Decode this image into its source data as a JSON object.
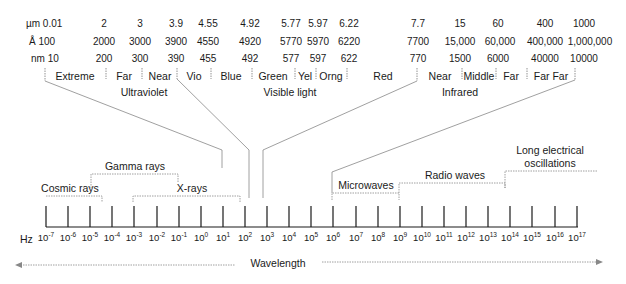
{
  "units": {
    "um": {
      "label": "µm 0.01",
      "values": [
        "2",
        "3",
        "3.9",
        "4.55",
        "4.92",
        "5.77",
        "5.97",
        "6.22",
        "7.7",
        "15",
        "60",
        "400",
        "1000"
      ]
    },
    "angstrom": {
      "label": "Å 100",
      "values": [
        "2000",
        "3000",
        "3900",
        "4550",
        "4920",
        "5770",
        "5970",
        "6220",
        "7700",
        "15,000",
        "60,000",
        "400,000",
        "1,000,000"
      ]
    },
    "nm": {
      "label": "nm 10",
      "values": [
        "200",
        "300",
        "390",
        "455",
        "492",
        "577",
        "597",
        "622",
        "770",
        "1500",
        "6000",
        "40000",
        "10000"
      ]
    }
  },
  "subbands": [
    "Extreme",
    "Far",
    "Near",
    "Vio",
    "Blue",
    "Green",
    "Yel",
    "Orng",
    "Red",
    "Near",
    "Middle",
    "Far",
    "Far Far"
  ],
  "groups": {
    "ultraviolet": "Ultraviolet",
    "visible": "Visible light",
    "infrared": "Infrared"
  },
  "bands": {
    "gamma": "Gamma rays",
    "cosmic": "Cosmic rays",
    "xrays": "X-rays",
    "microwaves": "Microwaves",
    "radio": "Radio waves",
    "long1": "Long electrical",
    "long2": "oscillations"
  },
  "axis": {
    "unit": "Hz",
    "base": "10",
    "exponents": [
      "-7",
      "-6",
      "-5",
      "-4",
      "-3",
      "-2",
      "-1",
      "0",
      "1",
      "2",
      "3",
      "4",
      "5",
      "6",
      "7",
      "8",
      "9",
      "10",
      "11",
      "12",
      "13",
      "14",
      "15",
      "16",
      "17"
    ]
  },
  "wavelength_label": "Wavelength"
}
